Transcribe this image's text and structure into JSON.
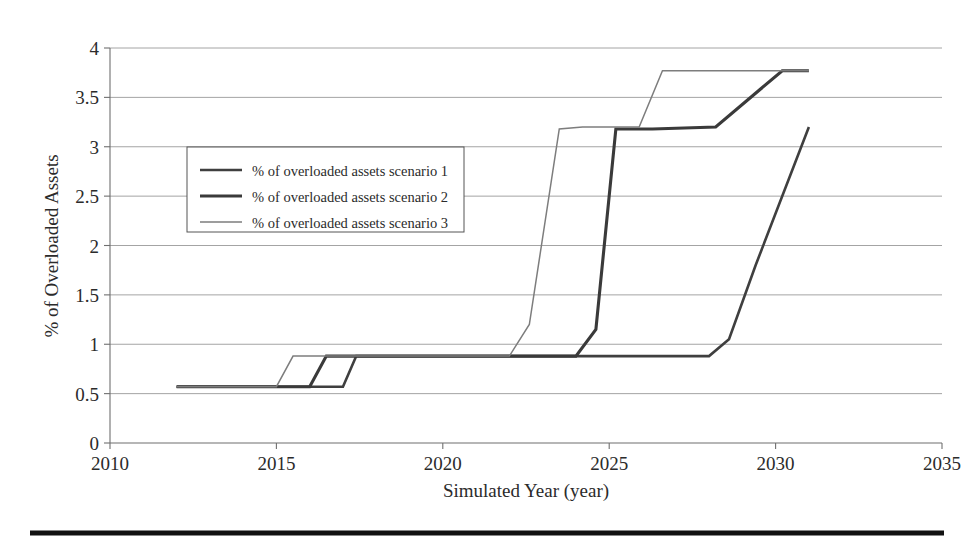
{
  "chart_data": {
    "type": "line",
    "title": "",
    "xlabel": "Simulated Year (year)",
    "ylabel": "% of Overloaded Assets",
    "xlim": [
      2010,
      2035
    ],
    "ylim": [
      0,
      4
    ],
    "xticks": [
      "2010",
      "2015",
      "2020",
      "2025",
      "2030",
      "2035"
    ],
    "yticks": [
      "0",
      "0.5",
      "1",
      "1.5",
      "2",
      "2.5",
      "3",
      "3.5",
      "4"
    ],
    "grid": true,
    "legend_position": "upper left inside",
    "series": [
      {
        "name": "% of overloaded assets scenario 1",
        "style": "medium-solid",
        "color": "#3f3f3f",
        "width": 2.6,
        "x": [
          2012,
          2017,
          2017.4,
          2028,
          2028.6,
          2029.4,
          2031
        ],
        "y": [
          0.57,
          0.57,
          0.88,
          0.88,
          1.05,
          1.8,
          3.2
        ]
      },
      {
        "name": "% of overloaded assets scenario 2",
        "style": "thick-solid",
        "color": "#3a3a3a",
        "width": 3.1,
        "x": [
          2012,
          2016,
          2016.5,
          2024,
          2024.6,
          2025.2,
          2026.3,
          2028.2,
          2030.2,
          2031
        ],
        "y": [
          0.57,
          0.57,
          0.88,
          0.88,
          1.15,
          3.18,
          3.18,
          3.2,
          3.77,
          3.77
        ]
      },
      {
        "name": "% of overloaded assets scenario 3",
        "style": "thin-solid",
        "color": "#7d7d7d",
        "width": 1.5,
        "x": [
          2012,
          2015,
          2015.5,
          2022,
          2022.6,
          2023.5,
          2024.2,
          2025.9,
          2026.6,
          2031
        ],
        "y": [
          0.57,
          0.57,
          0.88,
          0.88,
          1.2,
          3.18,
          3.2,
          3.2,
          3.77,
          3.77
        ]
      }
    ]
  },
  "legend": {
    "entries": [
      {
        "label": "% of overloaded assets scenario 1"
      },
      {
        "label": "% of overloaded assets scenario 2"
      },
      {
        "label": "% of overloaded assets scenario 3"
      }
    ]
  },
  "axes": {
    "x_title": "Simulated Year (year)",
    "y_title": "% of Overloaded Assets",
    "x_tick_labels": [
      "2010",
      "2015",
      "2020",
      "2025",
      "2030",
      "2035"
    ],
    "y_tick_labels": [
      "4",
      "3.5",
      "3",
      "2.5",
      "2",
      "1.5",
      "1",
      "0.5",
      "0"
    ]
  }
}
